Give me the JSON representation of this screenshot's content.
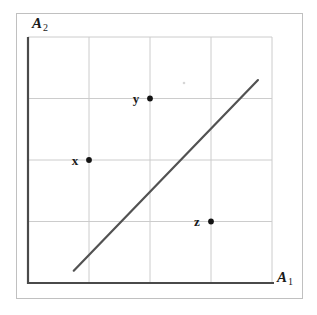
{
  "figure": {
    "background": "#ffffff",
    "frame_color": "#c0c0c0"
  },
  "chart_data": {
    "type": "scatter",
    "title": "",
    "xlabel": "A1",
    "ylabel": "A2",
    "axes": {
      "x": {
        "letter": "A",
        "sub": "1"
      },
      "y": {
        "letter": "A",
        "sub": "2"
      }
    },
    "xlim": [
      0,
      4
    ],
    "ylim": [
      0,
      4
    ],
    "grid": {
      "on": true,
      "cols": 4,
      "rows": 4,
      "color": "#cccccc"
    },
    "axis_color": "#4a4a4a",
    "tick_labels": "none",
    "legend": "none",
    "points": [
      {
        "label": "x",
        "x": 1,
        "y": 2
      },
      {
        "label": "y",
        "x": 2,
        "y": 3
      },
      {
        "label": "z",
        "x": 3,
        "y": 1
      }
    ],
    "point_color": "#141414",
    "point_label_color": "#1a1a1a",
    "separator_line": {
      "x1": 0.75,
      "y1": 0.2,
      "x2": 3.77,
      "y2": 3.3,
      "color": "#525252"
    }
  },
  "artifact_speck": {
    "x": 184,
    "y": 83,
    "color": "#d6d6d6"
  }
}
